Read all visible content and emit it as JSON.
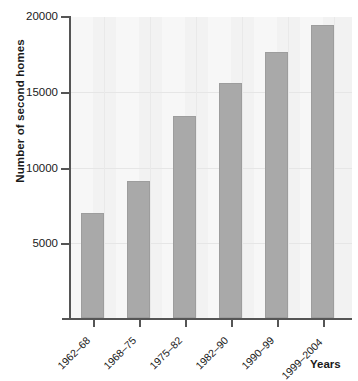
{
  "chart_data": {
    "type": "bar",
    "title": "",
    "xlabel": "Years",
    "ylabel": "Number of second homes",
    "categories": [
      "1962–68",
      "1968–75",
      "1975–82",
      "1982–90",
      "1990–99",
      "1999–2004"
    ],
    "values": [
      7000,
      9100,
      13400,
      15600,
      17700,
      19500
    ],
    "ylim": [
      0,
      20000
    ],
    "yticks": [
      5000,
      10000,
      15000,
      20000
    ],
    "ytick_labels": [
      "5000",
      "10000",
      "15000",
      "20000"
    ],
    "grid": true,
    "legend": null,
    "bar_color": "#a9a9a9",
    "plot_background": "#f2f2f2",
    "axis_color": "#555555"
  }
}
